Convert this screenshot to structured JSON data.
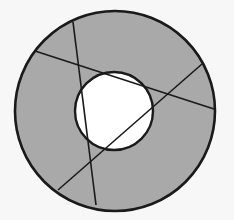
{
  "diagram": {
    "type": "annulus-with-chords",
    "colors": {
      "background": "#f7f7f7",
      "annulus_fill": "#a9a9a9",
      "inner_fill": "#ffffff",
      "stroke": "#1a1a1a"
    },
    "outer_circle": {
      "cx": 115,
      "cy": 111,
      "r": 100
    },
    "inner_circle": {
      "cx": 114,
      "cy": 111,
      "r": 39
    },
    "chords": [
      {
        "x1": 73,
        "y1": 22,
        "x2": 96,
        "y2": 205
      },
      {
        "x1": 35,
        "y1": 51,
        "x2": 214,
        "y2": 109
      },
      {
        "x1": 58,
        "y1": 190,
        "x2": 202,
        "y2": 64
      }
    ]
  }
}
